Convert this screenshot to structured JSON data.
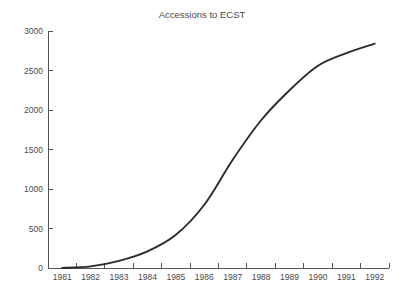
{
  "chart_data": {
    "type": "line",
    "title": "Accessions to ECST",
    "xlabel": "",
    "ylabel": "",
    "x": [
      1981,
      1982,
      1983,
      1984,
      1985,
      1986,
      1987,
      1988,
      1989,
      1990,
      1991,
      1992
    ],
    "categories": [
      "1981",
      "1982",
      "1983",
      "1984",
      "1985",
      "1986",
      "1987",
      "1988",
      "1989",
      "1990",
      "1991",
      "1992"
    ],
    "series": [
      {
        "name": "Accessions",
        "values": [
          0,
          20,
          90,
          210,
          420,
          800,
          1370,
          1870,
          2250,
          2560,
          2720,
          2840
        ]
      }
    ],
    "xlim": [
      1980.5,
      1992.5
    ],
    "ylim": [
      0,
      3000
    ],
    "ytick_labels": [
      "0",
      "500",
      "1000",
      "1500",
      "2000",
      "2500",
      "3000"
    ],
    "ytick_values": [
      0,
      500,
      1000,
      1500,
      2000,
      2500,
      3000
    ],
    "xtick_labels": [
      "1981",
      "1982",
      "1983",
      "1984",
      "1985",
      "1986",
      "1987",
      "1988",
      "1989",
      "1990",
      "1991",
      "1992"
    ],
    "xtick_boundaries": [
      1980.5,
      1981.5,
      1982.5,
      1983.5,
      1984.5,
      1985.5,
      1986.5,
      1987.5,
      1988.5,
      1989.5,
      1990.5,
      1991.5,
      1992.5
    ],
    "grid": false,
    "legend": false,
    "legend_position": "none",
    "line_color": "#2b2b2b",
    "axis_color": "#555555",
    "text_color": "#4a4a4a",
    "background_color": "#ffffff"
  }
}
